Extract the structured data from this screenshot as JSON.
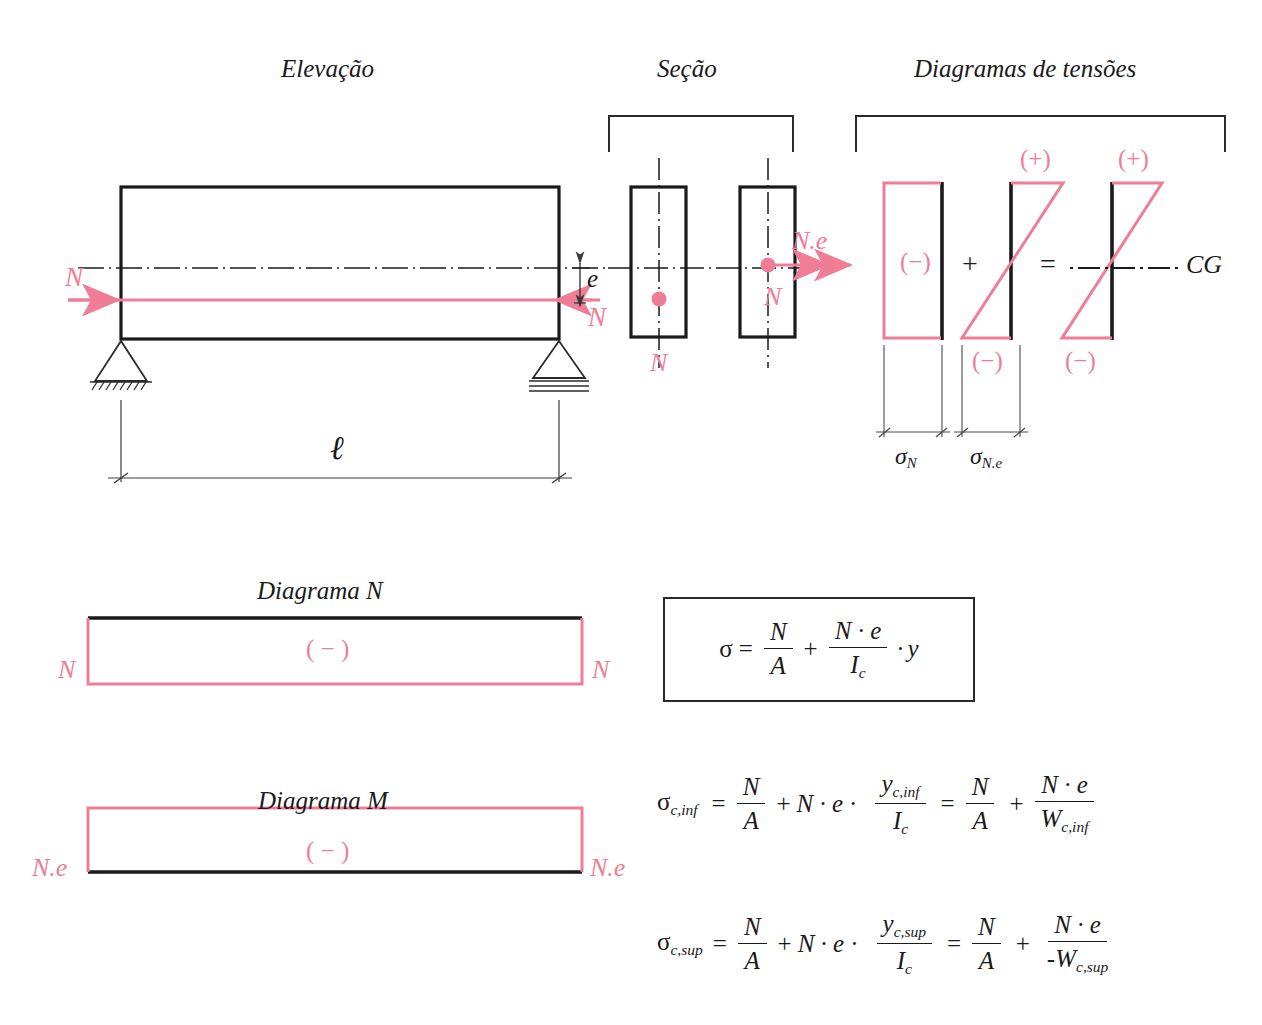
{
  "figure": {
    "type": "engineering-diagram",
    "accent_color": "#ef7d95",
    "line_color": "#1a1a1a"
  },
  "titles": {
    "elevation": "Elevação",
    "section": "Seção",
    "stress_diagrams": "Diagramas de tensões"
  },
  "elevation": {
    "force_left_label": "N",
    "force_right_label": "N",
    "eccentricity_label": "e",
    "span_label": "ℓ",
    "support_left": "pinned-support",
    "support_right": "roller-support"
  },
  "section": {
    "left": {
      "centroid_force_label": "N",
      "axis_label": "N"
    },
    "right": {
      "moment_label": "N.e",
      "force_label": "N"
    }
  },
  "stress": {
    "d1": {
      "sign_mid": "(−)",
      "dim_label_sigma": "σ",
      "dim_label_sub": "N"
    },
    "plus_operator": "+",
    "d2": {
      "sign_top": "(+)",
      "sign_bottom": "(−)",
      "dim_label_sigma": "σ",
      "dim_label_sub": "N.e"
    },
    "equals_operator": "=",
    "d3": {
      "sign_top": "(+)",
      "sign_bottom": "(−)"
    },
    "cg_label": "CG"
  },
  "diagram_n": {
    "title": "Diagrama N",
    "sign": "( − )",
    "left_label": "N",
    "right_label": "N"
  },
  "diagram_m": {
    "title": "Diagrama M",
    "sign": "( − )",
    "left_label": "N.e",
    "right_label": "N.e"
  },
  "formulas": {
    "boxed": {
      "lhs": "σ",
      "eq": "=",
      "f1_num": "N",
      "f1_den": "A",
      "op1": "+",
      "f2_num": "N · e",
      "f2_den_base": "I",
      "f2_den_sub": "c",
      "op2": "·",
      "tail": "y"
    },
    "inf": {
      "lhs_base": "σ",
      "lhs_sub": "c,inf",
      "eq1": "=",
      "f1_num": "N",
      "f1_den": "A",
      "op1": "+",
      "mid": "N · e",
      "op2": "·",
      "f2_num_base": "y",
      "f2_num_sub": "c,inf",
      "f2_den_base": "I",
      "f2_den_sub": "c",
      "eq2": "=",
      "f3_num": "N",
      "f3_den": "A",
      "op3": "+",
      "f4_num": "N · e",
      "f4_den_base": "W",
      "f4_den_sub": "c,inf"
    },
    "sup": {
      "lhs_base": "σ",
      "lhs_sub": "c,sup",
      "eq1": "=",
      "f1_num": "N",
      "f1_den": "A",
      "op1": "+",
      "mid": "N · e",
      "op2": "·",
      "f2_num_base": "y",
      "f2_num_sub": "c,sup",
      "f2_den_base": "I",
      "f2_den_sub": "c",
      "eq2": "=",
      "f3_num": "N",
      "f3_den": "A",
      "op3": "+",
      "f4_num": "N · e",
      "f4_den_prefix": "-",
      "f4_den_base": "W",
      "f4_den_sub": "c,sup"
    }
  }
}
